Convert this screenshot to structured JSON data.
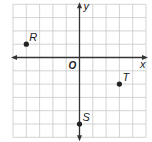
{
  "figure": {
    "type": "coordinate-plane",
    "x_axis_label": "x",
    "y_axis_label": "y",
    "origin_label": "O",
    "x_range": [
      -5,
      5
    ],
    "y_range": [
      -6,
      4
    ],
    "grid": true,
    "colors": {
      "grid": "#c8c8c8",
      "axis": "#333333",
      "point": "#222222",
      "background": "#ffffff"
    }
  },
  "points": [
    {
      "label": "R",
      "x": -4,
      "y": 1
    },
    {
      "label": "T",
      "x": 3,
      "y": -2
    },
    {
      "label": "S",
      "x": 0,
      "y": -5
    }
  ]
}
